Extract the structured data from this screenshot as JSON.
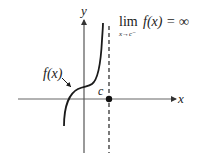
{
  "figure": {
    "type": "diagram",
    "colors": {
      "curve": "#1a1a1a",
      "axis": "#555555",
      "asymptote": "#333333",
      "point": "#111111"
    }
  },
  "labels": {
    "y_axis": "y",
    "x_axis": "x",
    "function": "f(x)",
    "point_c": "c",
    "limit_lim": "lim",
    "limit_sub": "x→c⁻",
    "limit_expr": "f(x) = ∞"
  },
  "elements": {
    "asymptote": {
      "style": "dashed",
      "x_label": "c"
    },
    "point": {
      "label": "c",
      "filled": true
    }
  }
}
